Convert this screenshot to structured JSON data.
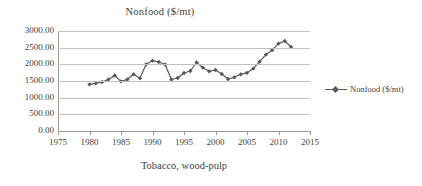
{
  "chart_data": {
    "type": "line",
    "title": "Nonfood ($/mt)",
    "xlabel": "Tobacco, wood-pulp",
    "ylabel": "",
    "xlim": [
      1975,
      2015
    ],
    "ylim": [
      0,
      3000
    ],
    "grid": true,
    "legend_position": "right",
    "series": [
      {
        "name": "Nonfood ($/mt)",
        "color": "#595959",
        "marker": "diamond",
        "x": [
          1980,
          1981,
          1982,
          1983,
          1984,
          1985,
          1986,
          1987,
          1988,
          1989,
          1990,
          1991,
          1992,
          1993,
          1994,
          1995,
          1996,
          1997,
          1998,
          1999,
          2000,
          2001,
          2002,
          2003,
          2004,
          2005,
          2006,
          2007,
          2008,
          2009,
          2010,
          2011,
          2012
        ],
        "values": [
          1400,
          1430,
          1470,
          1545,
          1665,
          1490,
          1545,
          1700,
          1580,
          2000,
          2110,
          2070,
          1995,
          1545,
          1590,
          1740,
          1800,
          2055,
          1900,
          1790,
          1830,
          1710,
          1560,
          1610,
          1700,
          1745,
          1870,
          2080,
          2290,
          2430,
          2620,
          2700,
          2520
        ]
      }
    ],
    "y_ticks": [
      "0.00",
      "500.00",
      "1000.00",
      "1500.00",
      "2000.00",
      "2500.00",
      "3000.00"
    ],
    "y_tick_values": [
      0,
      500,
      1000,
      1500,
      2000,
      2500,
      3000
    ],
    "x_ticks": [
      "1975",
      "1980",
      "1985",
      "1990",
      "1995",
      "2000",
      "2005",
      "2010",
      "2015"
    ],
    "x_tick_values": [
      1975,
      1980,
      1985,
      1990,
      1995,
      2000,
      2005,
      2010,
      2015
    ],
    "legend": [
      {
        "label": "Nonfood ($/mt)",
        "color": "#595959"
      }
    ]
  },
  "style": {
    "gridline_color": "#bfbfbf",
    "axis_color": "#9a9a9a",
    "text_color": "#3f3f3f",
    "background": "#ffffff"
  }
}
